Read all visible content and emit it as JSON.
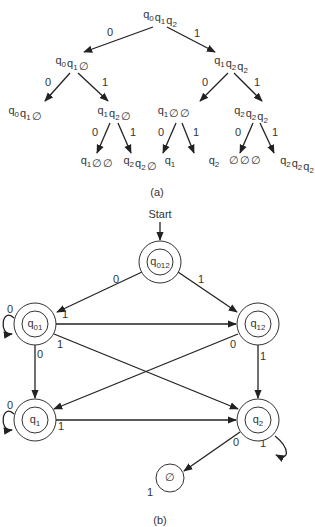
{
  "tree": {
    "caption": "(a)",
    "nodes": [
      {
        "id": "root",
        "label": [
          [
            "q",
            "0"
          ],
          [
            "q",
            "1"
          ],
          [
            "q",
            "2"
          ]
        ]
      },
      {
        "id": "n0",
        "label": [
          [
            "q",
            "0"
          ],
          [
            "q",
            "1"
          ],
          [
            "∅",
            ""
          ]
        ]
      },
      {
        "id": "n1",
        "label": [
          [
            "q",
            "1"
          ],
          [
            "q",
            "2"
          ],
          [
            "q",
            "2"
          ]
        ]
      },
      {
        "id": "n00",
        "label": [
          [
            "q",
            "0"
          ],
          [
            "q",
            "1"
          ],
          [
            "∅",
            ""
          ]
        ]
      },
      {
        "id": "n01",
        "label": [
          [
            "q",
            "1"
          ],
          [
            "q",
            "2"
          ],
          [
            "∅",
            ""
          ]
        ]
      },
      {
        "id": "n10",
        "label": [
          [
            "q",
            "1"
          ],
          [
            "∅",
            ""
          ],
          [
            "∅",
            ""
          ]
        ]
      },
      {
        "id": "n11",
        "label": [
          [
            "q",
            "2"
          ],
          [
            "q",
            "2"
          ],
          [
            "q",
            "2"
          ]
        ]
      },
      {
        "id": "n010",
        "label": [
          [
            "q",
            "1"
          ],
          [
            "∅",
            ""
          ],
          [
            "∅",
            ""
          ]
        ]
      },
      {
        "id": "n011",
        "label": [
          [
            "q",
            "2"
          ],
          [
            "q",
            "2"
          ],
          [
            "∅",
            ""
          ]
        ]
      },
      {
        "id": "n100",
        "label": [
          [
            "q",
            "1"
          ]
        ]
      },
      {
        "id": "n101",
        "label": [
          [
            "q",
            "2"
          ]
        ]
      },
      {
        "id": "n110",
        "label": [
          [
            "∅",
            ""
          ],
          [
            "∅",
            ""
          ],
          [
            "∅",
            ""
          ]
        ]
      },
      {
        "id": "n111",
        "label": [
          [
            "q",
            "2"
          ],
          [
            "q",
            "2"
          ],
          [
            "q",
            "2"
          ]
        ]
      }
    ],
    "edges": [
      {
        "from": "root",
        "to": "n0",
        "label": "0"
      },
      {
        "from": "root",
        "to": "n1",
        "label": "1"
      },
      {
        "from": "n0",
        "to": "n00",
        "label": "0"
      },
      {
        "from": "n0",
        "to": "n01",
        "label": "1"
      },
      {
        "from": "n1",
        "to": "n10",
        "label": "0"
      },
      {
        "from": "n1",
        "to": "n11",
        "label": "1"
      },
      {
        "from": "n01",
        "to": "n010",
        "label": "0"
      },
      {
        "from": "n01",
        "to": "n011",
        "label": "1"
      },
      {
        "from": "n10",
        "to": "n100",
        "label": "0"
      },
      {
        "from": "n10",
        "to": "n101",
        "label": "1"
      },
      {
        "from": "n11",
        "to": "n110",
        "label": "0"
      },
      {
        "from": "n11",
        "to": "n111",
        "label": "1"
      }
    ]
  },
  "automaton": {
    "caption": "(b)",
    "start_label": "Start",
    "states": [
      {
        "id": "q012",
        "base": "q",
        "sub": "012",
        "accepting": true
      },
      {
        "id": "q01",
        "base": "q",
        "sub": "01",
        "accepting": true
      },
      {
        "id": "q12",
        "base": "q",
        "sub": "12",
        "accepting": true
      },
      {
        "id": "q1",
        "base": "q",
        "sub": "1",
        "accepting": true
      },
      {
        "id": "q2",
        "base": "q",
        "sub": "2",
        "accepting": true
      },
      {
        "id": "empty",
        "base": "∅",
        "sub": "",
        "accepting": false
      }
    ],
    "transitions": [
      {
        "from": "q012",
        "to": "q01",
        "label": "0"
      },
      {
        "from": "q012",
        "to": "q12",
        "label": "1"
      },
      {
        "from": "q01",
        "to": "q01",
        "label": "0"
      },
      {
        "from": "q01",
        "to": "q12",
        "label": "1"
      },
      {
        "from": "q01",
        "to": "q1",
        "label": "0"
      },
      {
        "from": "q01",
        "to": "q2",
        "label": "1"
      },
      {
        "from": "q12",
        "to": "q1",
        "label": "0"
      },
      {
        "from": "q12",
        "to": "q2",
        "label": "1"
      },
      {
        "from": "q1",
        "to": "q1",
        "label": "0"
      },
      {
        "from": "q1",
        "to": "q2",
        "label": "1"
      },
      {
        "from": "q2",
        "to": "empty",
        "label": "0"
      },
      {
        "from": "q2",
        "to": "q2",
        "label": "1"
      },
      {
        "from": "empty",
        "to": "empty",
        "label": "1"
      }
    ]
  }
}
